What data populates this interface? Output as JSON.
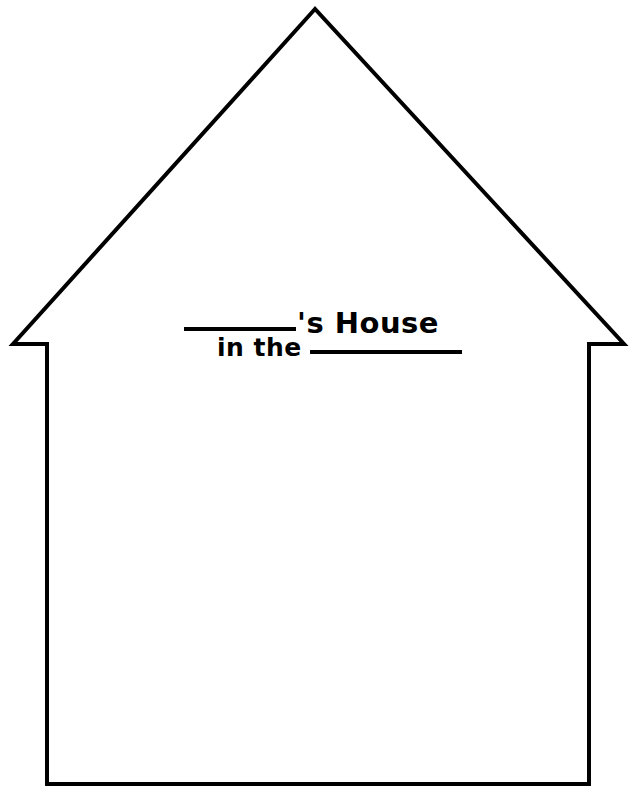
{
  "page": {
    "background_color": "#ffffff",
    "ink_color": "#000000",
    "width": 637,
    "height": 798
  },
  "worksheet": {
    "title_line_1": {
      "blank_label": "name-blank",
      "suffix": "'s House"
    },
    "title_line_2": {
      "prefix": "in the",
      "blank_label": "place-blank"
    }
  },
  "illustration": {
    "name": "house-outline",
    "description": "House outline with pitched roof and overhanging eaves",
    "stroke_color": "#000000",
    "fill_color": "#ffffff",
    "stroke_width": 4,
    "points": {
      "apex": [
        315,
        9
      ],
      "left_eave_tip": [
        13,
        344
      ],
      "left_eave_inner": [
        47,
        344
      ],
      "left_wall_bottom": [
        47,
        784
      ],
      "right_wall_bottom": [
        589,
        784
      ],
      "right_eave_inner": [
        589,
        344
      ],
      "right_eave_tip": [
        624,
        344
      ]
    }
  }
}
